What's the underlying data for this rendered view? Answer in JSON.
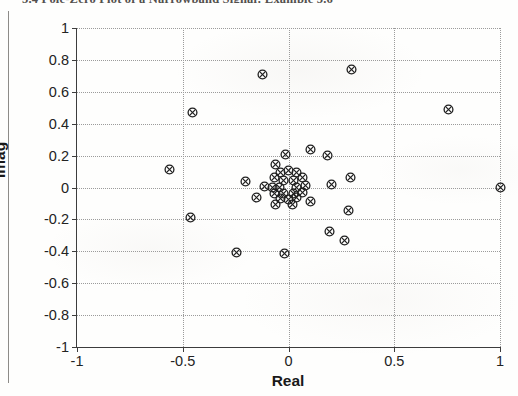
{
  "page": {
    "running_header": "5.4   Pole-Zero Plot of a Narrowband Signal: Example 5.6",
    "header_visible": "truncated"
  },
  "figure": {
    "xlabel": "Real",
    "ylabel": "Imag",
    "marker_symbol": "circle-x",
    "marker_color": "#1f1f1f",
    "axis_color": "#3d3d3d",
    "grid_color": "#9b9b9b"
  },
  "chart_data": {
    "type": "scatter",
    "title": "",
    "xlabel": "Real",
    "ylabel": "Imag",
    "xlim": [
      -1,
      1
    ],
    "ylim": [
      -1,
      1
    ],
    "xticks": [
      -1,
      -0.5,
      0,
      0.5,
      1
    ],
    "xticklabels": [
      "-1",
      "-0.5",
      "0",
      "0.5",
      "1"
    ],
    "yticks": [
      -1,
      -0.8,
      -0.6,
      -0.4,
      -0.2,
      0,
      0.2,
      0.4,
      0.6,
      0.8,
      1
    ],
    "yticklabels": [
      "-1",
      "-0.8",
      "-0.6",
      "-0.4",
      "-0.2",
      "0",
      "0.2",
      "0.4",
      "0.6",
      "0.8",
      "1"
    ],
    "grid": true,
    "grid_style": "dotted",
    "legend": null,
    "series": [
      {
        "name": "zeros",
        "marker": "circle-x",
        "points": [
          [
            -0.125,
            0.71
          ],
          [
            0.3,
            0.74
          ],
          [
            -0.455,
            0.47
          ],
          [
            0.755,
            0.49
          ],
          [
            -0.565,
            0.115
          ],
          [
            1.0,
            0.0
          ],
          [
            -0.013,
            0.205
          ],
          [
            0.105,
            0.24
          ],
          [
            0.185,
            0.2
          ],
          [
            -0.062,
            0.145
          ],
          [
            0.295,
            0.065
          ],
          [
            -0.205,
            0.035
          ],
          [
            -0.115,
            0.005
          ],
          [
            0.205,
            0.02
          ],
          [
            -0.065,
            0.065
          ],
          [
            -0.04,
            0.095
          ],
          [
            0.0,
            0.105
          ],
          [
            0.04,
            0.095
          ],
          [
            0.068,
            0.06
          ],
          [
            0.08,
            0.015
          ],
          [
            0.068,
            -0.03
          ],
          [
            0.04,
            -0.062
          ],
          [
            0.0,
            -0.078
          ],
          [
            -0.04,
            -0.068
          ],
          [
            -0.068,
            -0.04
          ],
          [
            -0.078,
            0.0
          ],
          [
            -0.022,
            0.042
          ],
          [
            0.022,
            0.042
          ],
          [
            0.04,
            0.0
          ],
          [
            0.022,
            -0.038
          ],
          [
            -0.022,
            -0.038
          ],
          [
            -0.042,
            0.0
          ],
          [
            -0.15,
            -0.065
          ],
          [
            -0.06,
            -0.105
          ],
          [
            0.02,
            -0.105
          ],
          [
            0.105,
            -0.085
          ],
          [
            0.285,
            -0.145
          ],
          [
            -0.465,
            -0.185
          ],
          [
            0.195,
            -0.275
          ],
          [
            -0.245,
            -0.405
          ],
          [
            -0.018,
            -0.415
          ],
          [
            0.265,
            -0.335
          ]
        ]
      }
    ]
  }
}
